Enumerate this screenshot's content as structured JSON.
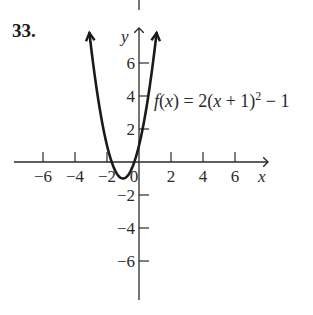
{
  "problem": {
    "number": "33."
  },
  "chart_data": {
    "type": "line",
    "title": "",
    "function_label": "f(x) = 2(x + 1)² − 1",
    "function_label_parts": {
      "lhs": "f(x) =",
      "rhs_base": "2(x + 1)",
      "exp": "2",
      "rhs_tail": " − 1"
    },
    "xlabel": "x",
    "ylabel": "y",
    "xlim": [
      -7,
      8
    ],
    "ylim": [
      -8,
      8
    ],
    "x_ticks": [
      -6,
      -4,
      -2,
      0,
      2,
      4,
      6
    ],
    "x_tick_labels": [
      "−6",
      "−4",
      "−2",
      "0",
      "2",
      "4",
      "6"
    ],
    "y_ticks": [
      -6,
      -4,
      -2,
      2,
      4,
      6
    ],
    "y_tick_labels": [
      "−6",
      "−4",
      "−2",
      "2",
      "4",
      "6"
    ],
    "grid": false,
    "series": [
      {
        "name": "f(x) = 2(x+1)^2 - 1",
        "vertex": [
          -1,
          -1
        ],
        "x": [
          -3.1,
          -3.0,
          -2.5,
          -2.0,
          -1.5,
          -1.0,
          -0.5,
          0.0,
          0.5,
          1.0,
          1.1
        ],
        "y": [
          7.82,
          7.0,
          3.5,
          1.0,
          -0.5,
          -1.0,
          -0.5,
          1.0,
          3.5,
          7.0,
          7.82
        ]
      }
    ],
    "color": "#1a1a1a"
  }
}
